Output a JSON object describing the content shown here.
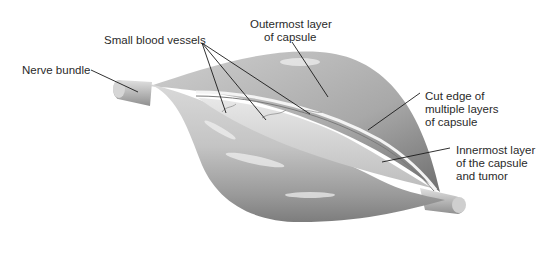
{
  "diagram": {
    "labels": {
      "nerve_bundle": "Nerve bundle",
      "small_blood_vessels": "Small blood vessels",
      "outermost_layer": [
        "Outermost layer",
        "of capsule"
      ],
      "cut_edge": [
        "Cut edge of",
        "multiple layers",
        "of capsule"
      ],
      "innermost_layer": [
        "Innermost layer",
        "of the capsule",
        "and tumor"
      ]
    },
    "colors": {
      "background": "#ffffff",
      "text": "#2a2a2a",
      "leader_line": "#1a1a1a",
      "capsule_light": "#e6e6e6",
      "capsule_mid": "#b5b5b5",
      "capsule_dark": "#7a7a7a"
    }
  }
}
